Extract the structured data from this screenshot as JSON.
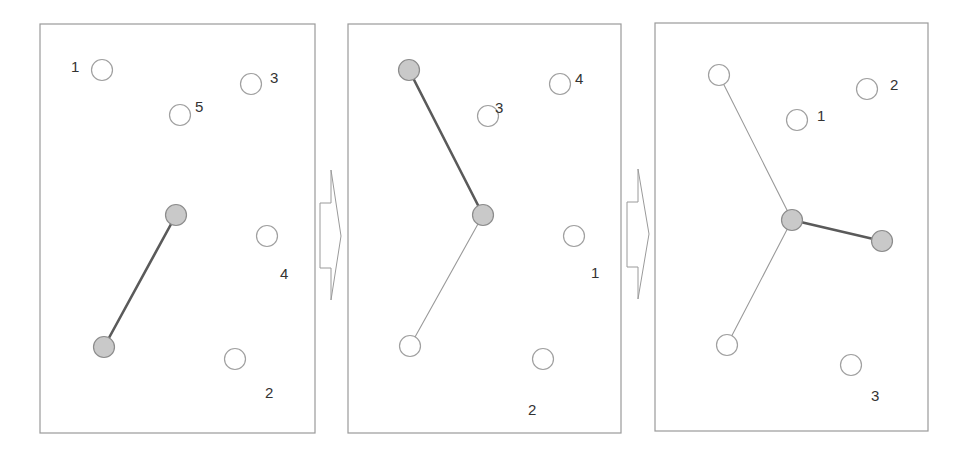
{
  "diagram": {
    "colors": {
      "frame": "#9a9a9a",
      "tree_node_fill": "#c9c9c9",
      "tree_node_stroke": "#8c8c8c",
      "free_node_stroke": "#a0a0a0",
      "new_edge": "#5a5a5a",
      "old_edge": "#9a9a9a",
      "label": "#333333"
    },
    "panels": [
      {
        "id": "step-1",
        "frame": {
          "x": 40,
          "y": 24,
          "w": 275,
          "h": 409
        },
        "edges": [
          {
            "x1": 176,
            "y1": 215,
            "x2": 104,
            "y2": 347,
            "type": "new"
          }
        ],
        "tree_nodes": [
          {
            "x": 176,
            "y": 215,
            "state": "gray"
          },
          {
            "x": 104,
            "y": 347,
            "state": "gray"
          }
        ],
        "candidates": [
          {
            "label": "1",
            "x": 102,
            "y": 70,
            "lx": 71,
            "ly": 67
          },
          {
            "label": "5",
            "x": 180,
            "y": 115,
            "lx": 195,
            "ly": 107
          },
          {
            "label": "3",
            "x": 251,
            "y": 84,
            "lx": 270,
            "ly": 78
          },
          {
            "label": "4",
            "x": 267,
            "y": 236,
            "lx": 280,
            "ly": 274
          },
          {
            "label": "2",
            "x": 235,
            "y": 359,
            "lx": 265,
            "ly": 393
          }
        ]
      },
      {
        "id": "step-2",
        "frame": {
          "x": 348,
          "y": 24,
          "w": 273,
          "h": 409
        },
        "edges": [
          {
            "x1": 483,
            "y1": 215,
            "x2": 410,
            "y2": 346,
            "type": "old"
          },
          {
            "x1": 409,
            "y1": 70,
            "x2": 483,
            "y2": 215,
            "type": "new"
          }
        ],
        "tree_nodes": [
          {
            "x": 409,
            "y": 70,
            "state": "gray"
          },
          {
            "x": 483,
            "y": 215,
            "state": "gray"
          },
          {
            "x": 410,
            "y": 346,
            "state": "white"
          }
        ],
        "candidates": [
          {
            "label": "3",
            "x": 488,
            "y": 116,
            "lx": 495,
            "ly": 108
          },
          {
            "label": "4",
            "x": 560,
            "y": 84,
            "lx": 575,
            "ly": 79
          },
          {
            "label": "1",
            "x": 574,
            "y": 236,
            "lx": 591,
            "ly": 273
          },
          {
            "label": "2",
            "x": 543,
            "y": 359,
            "lx": 528,
            "ly": 410
          }
        ]
      },
      {
        "id": "step-3",
        "frame": {
          "x": 655,
          "y": 23,
          "w": 273,
          "h": 408
        },
        "edges": [
          {
            "x1": 719,
            "y1": 75,
            "x2": 792,
            "y2": 220,
            "type": "old"
          },
          {
            "x1": 792,
            "y1": 220,
            "x2": 727,
            "y2": 345,
            "type": "old"
          },
          {
            "x1": 792,
            "y1": 220,
            "x2": 882,
            "y2": 241,
            "type": "new"
          }
        ],
        "tree_nodes": [
          {
            "x": 719,
            "y": 75,
            "state": "white"
          },
          {
            "x": 727,
            "y": 345,
            "state": "white"
          },
          {
            "x": 792,
            "y": 220,
            "state": "gray"
          },
          {
            "x": 882,
            "y": 241,
            "state": "gray"
          }
        ],
        "candidates": [
          {
            "label": "1",
            "x": 797,
            "y": 120,
            "lx": 817,
            "ly": 116
          },
          {
            "label": "2",
            "x": 867,
            "y": 89,
            "lx": 890,
            "ly": 85
          },
          {
            "label": "3",
            "x": 851,
            "y": 365,
            "lx": 871,
            "ly": 396
          }
        ]
      }
    ],
    "arrows": [
      {
        "id": "arrow-1-to-2",
        "shaft_x1": 320,
        "shaft_x2": 331,
        "shaft_y1": 203,
        "shaft_y2": 268,
        "head_y1": 170,
        "head_y2": 300,
        "tip_x": 341,
        "tip_y": 236
      },
      {
        "id": "arrow-2-to-3",
        "shaft_x1": 627,
        "shaft_x2": 638,
        "shaft_y1": 202,
        "shaft_y2": 267,
        "head_y1": 169,
        "head_y2": 299,
        "tip_x": 649,
        "tip_y": 234
      }
    ],
    "node_radius": 10.5
  }
}
